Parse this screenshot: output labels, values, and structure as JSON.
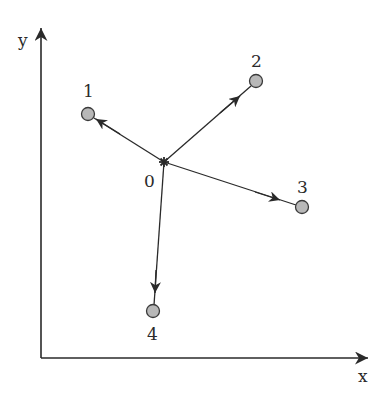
{
  "axes": {
    "x_label": "x",
    "y_label": "y",
    "origin": [
      41,
      358
    ],
    "x_end": [
      368,
      358
    ],
    "y_end": [
      41,
      28
    ]
  },
  "center": {
    "id": "0",
    "label": "0",
    "marker": "star",
    "pos": [
      164,
      162
    ],
    "label_pos": [
      150,
      186
    ]
  },
  "nodes": [
    {
      "id": "1",
      "label": "1",
      "pos": [
        88,
        114
      ],
      "label_pos": [
        89,
        97
      ]
    },
    {
      "id": "2",
      "label": "2",
      "pos": [
        256,
        81
      ],
      "label_pos": [
        257,
        66
      ]
    },
    {
      "id": "3",
      "label": "3",
      "pos": [
        302,
        207
      ],
      "label_pos": [
        303,
        193
      ]
    },
    {
      "id": "4",
      "label": "4",
      "pos": [
        153,
        311
      ],
      "label_pos": [
        153,
        339
      ]
    }
  ],
  "edges": [
    {
      "from": "0",
      "to": "1"
    },
    {
      "from": "0",
      "to": "2"
    },
    {
      "from": "0",
      "to": "3"
    },
    {
      "from": "0",
      "to": "4"
    }
  ],
  "colors": {
    "line": "#2a2a2a",
    "node_fill": "#b8b8b8",
    "node_stroke": "#3a3a3a"
  }
}
